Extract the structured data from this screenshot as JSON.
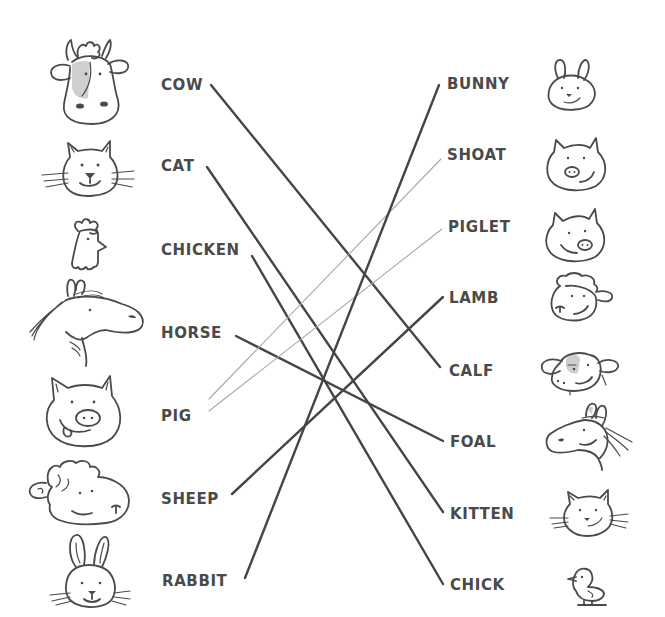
{
  "worksheet": {
    "left_column": [
      {
        "id": "cow",
        "label": "COW",
        "icon": "cow-face-icon"
      },
      {
        "id": "cat",
        "label": "CAT",
        "icon": "cat-face-icon"
      },
      {
        "id": "chicken",
        "label": "CHICKEN",
        "icon": "chicken-head-icon"
      },
      {
        "id": "horse",
        "label": "HORSE",
        "icon": "horse-head-icon"
      },
      {
        "id": "pig",
        "label": "PIG",
        "icon": "pig-face-icon"
      },
      {
        "id": "sheep",
        "label": "SHEEP",
        "icon": "sheep-face-icon"
      },
      {
        "id": "rabbit",
        "label": "RABBIT",
        "icon": "rabbit-face-icon"
      }
    ],
    "right_column": [
      {
        "id": "bunny",
        "label": "BUNNY",
        "icon": "bunny-face-icon"
      },
      {
        "id": "shoat",
        "label": "SHOAT",
        "icon": "shoat-face-icon"
      },
      {
        "id": "piglet",
        "label": "PIGLET",
        "icon": "piglet-face-icon"
      },
      {
        "id": "lamb",
        "label": "LAMB",
        "icon": "lamb-face-icon"
      },
      {
        "id": "calf",
        "label": "CALF",
        "icon": "calf-face-icon"
      },
      {
        "id": "foal",
        "label": "FOAL",
        "icon": "foal-head-icon"
      },
      {
        "id": "kitten",
        "label": "KITTEN",
        "icon": "kitten-face-icon"
      },
      {
        "id": "chick",
        "label": "CHICK",
        "icon": "chick-icon"
      }
    ],
    "matches": [
      {
        "from": "COW",
        "to": "CALF",
        "style": "thick"
      },
      {
        "from": "CAT",
        "to": "KITTEN",
        "style": "thick"
      },
      {
        "from": "CHICKEN",
        "to": "CHICK",
        "style": "thick"
      },
      {
        "from": "HORSE",
        "to": "FOAL",
        "style": "thick"
      },
      {
        "from": "PIG",
        "to": "SHOAT",
        "style": "thin"
      },
      {
        "from": "PIG",
        "to": "PIGLET",
        "style": "thin"
      },
      {
        "from": "SHEEP",
        "to": "LAMB",
        "style": "thick"
      },
      {
        "from": "RABBIT",
        "to": "BUNNY",
        "style": "thick"
      }
    ],
    "colors": {
      "text": "#4a4a4a",
      "thick_line": "#454545",
      "thin_line": "#a8a8a8",
      "background": "#ffffff"
    }
  }
}
